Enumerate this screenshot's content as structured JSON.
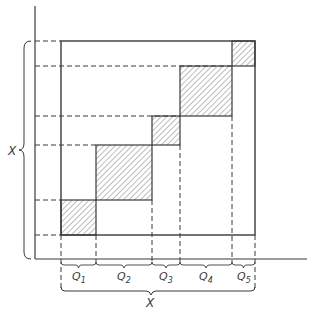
{
  "diagram": {
    "type": "block-diagonal partition",
    "axis_label_vertical": "X",
    "axis_label_horizontal": "X",
    "segments": [
      {
        "label": "Q",
        "sub": "1",
        "x0": 61,
        "x1": 96,
        "y0": 200,
        "y1": 235
      },
      {
        "label": "Q",
        "sub": "2",
        "x0": 96,
        "x1": 152,
        "y0": 145,
        "y1": 200
      },
      {
        "label": "Q",
        "sub": "3",
        "x0": 152,
        "x1": 180,
        "y0": 116,
        "y1": 145
      },
      {
        "label": "Q",
        "sub": "4",
        "x0": 180,
        "x1": 232,
        "y0": 66,
        "y1": 116
      },
      {
        "label": "Q",
        "sub": "5",
        "x0": 232,
        "x1": 255,
        "y0": 41,
        "y1": 66
      }
    ],
    "colors": {
      "line": "#3a3a3a",
      "hatch": "#6a6a6a",
      "background": "#ffffff"
    }
  }
}
